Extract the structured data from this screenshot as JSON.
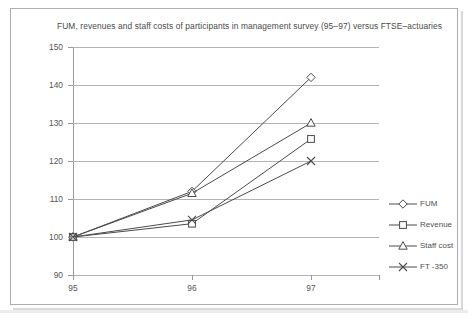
{
  "chart_data": {
    "type": "line",
    "title": "FUM, revenues and staff costs of participants in management survey (95–97) versus FTSE–actuaries",
    "xlabel": "",
    "ylabel": "",
    "categories": [
      "95",
      "96",
      "97"
    ],
    "x_tick_labels": [
      "95",
      "96",
      "97"
    ],
    "y_tick_labels": [
      "90",
      "100",
      "110",
      "120",
      "130",
      "140",
      "150"
    ],
    "y_tick_values": [
      90,
      100,
      110,
      120,
      130,
      140,
      150
    ],
    "ylim": [
      90,
      150
    ],
    "grid": "horizontal",
    "legend_position": "right",
    "series": [
      {
        "name": "FUM",
        "marker": "diamond",
        "values": [
          100,
          112,
          142
        ]
      },
      {
        "name": "Revenue",
        "marker": "square",
        "values": [
          100,
          103.5,
          125.8
        ]
      },
      {
        "name": "Staff cost",
        "marker": "triangle",
        "values": [
          100,
          111.5,
          130
        ]
      },
      {
        "name": "FT -350",
        "marker": "cross",
        "values": [
          100,
          104.5,
          120
        ]
      }
    ],
    "colors": {
      "line": "#4b4b4b",
      "grid": "#b4b4b4",
      "axis": "#9a9a9a",
      "text": "#555555",
      "frame": "#aeaeae",
      "background": "#ffffff"
    }
  },
  "legend": {
    "items": [
      {
        "label": "FUM",
        "glyph": "diamond-marker-icon"
      },
      {
        "label": "Revenue",
        "glyph": "square-marker-icon"
      },
      {
        "label": "Staff cost",
        "glyph": "triangle-marker-icon"
      },
      {
        "label": "FT -350",
        "glyph": "cross-marker-icon"
      }
    ]
  }
}
